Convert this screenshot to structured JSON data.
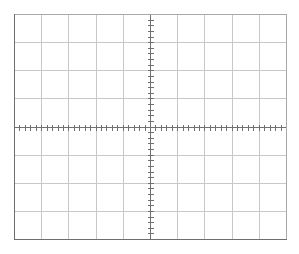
{
  "graticule": {
    "left": 14,
    "top": 14,
    "right": 286,
    "bottom": 239,
    "h_divisions": 10,
    "v_divisions": 8,
    "minor_ticks_per_division": 5,
    "tick_length": 3,
    "colors": {
      "background": "#ffffff",
      "grid": "#c8c8c8",
      "border_top_right": "#a8a8a8",
      "border_left_bottom": "#6e6e6e",
      "axis": "#707070"
    }
  }
}
